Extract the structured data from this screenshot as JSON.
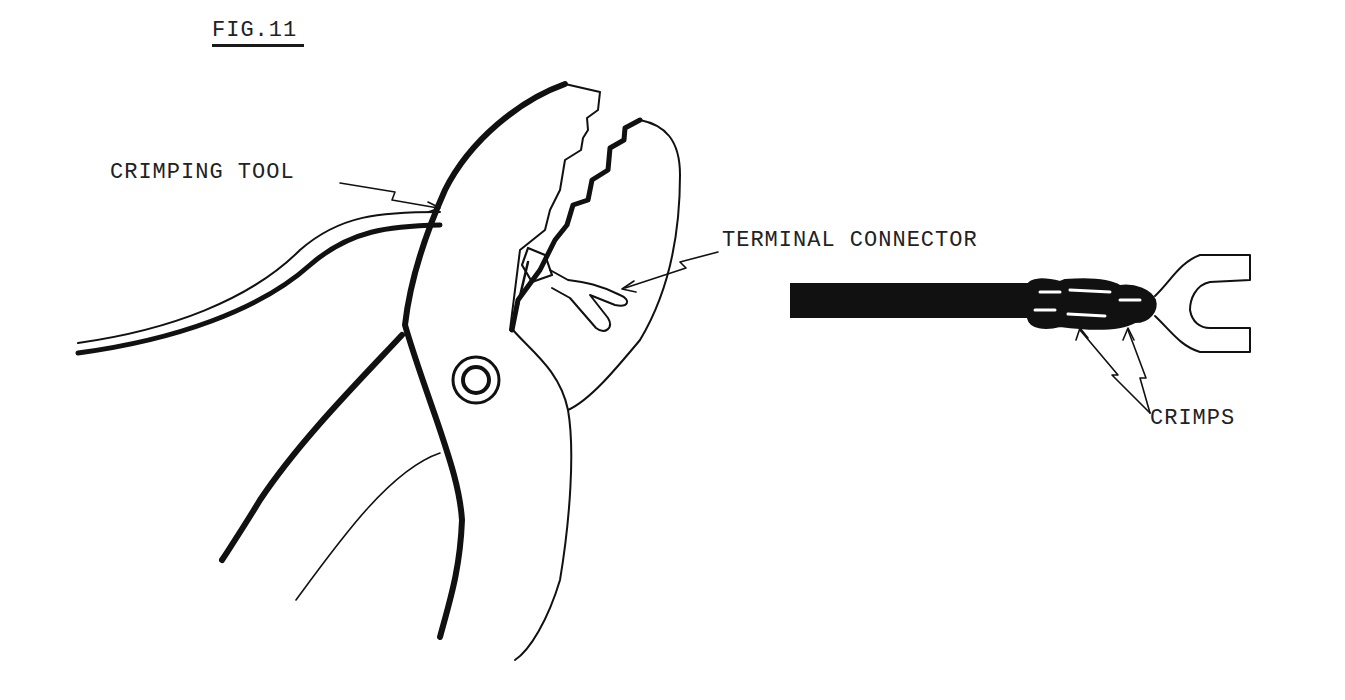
{
  "figure": {
    "title": "FIG.11",
    "labels": {
      "crimping_tool": "CRIMPING TOOL",
      "terminal_connector": "TERMINAL CONNECTOR",
      "crimps": "CRIMPS"
    },
    "ink_color": "#111111",
    "background": "#ffffff"
  }
}
